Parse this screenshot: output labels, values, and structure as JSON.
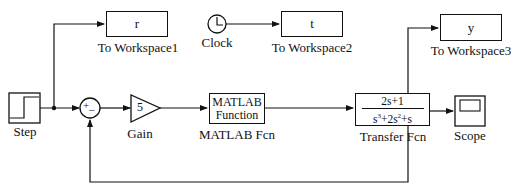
{
  "diagram": {
    "type": "simulink-block-diagram",
    "blocks": {
      "step": {
        "label": "Step"
      },
      "sum": {
        "signs": {
          "plus": "+",
          "minus": "−"
        }
      },
      "gain": {
        "value": "5",
        "label": "Gain"
      },
      "matlab_fcn": {
        "line1": "MATLAB",
        "line2": "Function",
        "label": "MATLAB Fcn"
      },
      "transfer_fcn": {
        "numerator": "2s+1",
        "denominator_parts": [
          "s",
          "3",
          "+2s",
          "2",
          "+s"
        ],
        "label": "Transfer Fcn"
      },
      "scope": {
        "label": "Scope"
      },
      "clock": {
        "label": "Clock"
      },
      "to_workspace1": {
        "variable": "r",
        "label": "To Workspace1"
      },
      "to_workspace2": {
        "variable": "t",
        "label": "To Workspace2"
      },
      "to_workspace3": {
        "variable": "y",
        "label": "To Workspace3"
      }
    },
    "connections": [
      {
        "from": "Step",
        "to": "Sum (+)"
      },
      {
        "from": "Step",
        "to": "To Workspace1"
      },
      {
        "from": "Sum",
        "to": "Gain"
      },
      {
        "from": "Gain",
        "to": "MATLAB Fcn"
      },
      {
        "from": "MATLAB Fcn",
        "to": "Transfer Fcn"
      },
      {
        "from": "Transfer Fcn",
        "to": "Scope"
      },
      {
        "from": "Transfer Fcn",
        "to": "To Workspace3"
      },
      {
        "from": "Transfer Fcn",
        "to": "Sum (−)",
        "type": "feedback"
      },
      {
        "from": "Clock",
        "to": "To Workspace2"
      }
    ]
  }
}
